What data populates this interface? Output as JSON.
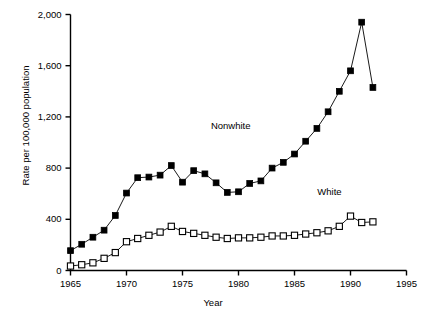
{
  "chart_data": {
    "type": "line",
    "title": "",
    "xlabel": "Year",
    "ylabel": "Rate per 100,000 population",
    "xlim": [
      1965,
      1995
    ],
    "ylim": [
      0,
      2000
    ],
    "xticks": [
      1965,
      1970,
      1975,
      1980,
      1985,
      1990,
      1995
    ],
    "xtick_labels": [
      "1965",
      "1970",
      "1975",
      "1980",
      "1985",
      "1990",
      "1995"
    ],
    "yticks": [
      0,
      400,
      800,
      1200,
      1600,
      2000
    ],
    "ytick_labels": [
      "0",
      "400",
      "800",
      "1,200",
      "1,600",
      "2,000"
    ],
    "grid": false,
    "legend_position": "inline-annotation",
    "x": [
      1965,
      1966,
      1967,
      1968,
      1969,
      1970,
      1971,
      1972,
      1973,
      1974,
      1975,
      1976,
      1977,
      1978,
      1979,
      1980,
      1981,
      1982,
      1983,
      1984,
      1985,
      1986,
      1987,
      1988,
      1989,
      1990,
      1991,
      1992
    ],
    "series": [
      {
        "name": "Nonwhite",
        "marker": "filled-square",
        "color": "#000000",
        "values": [
          155,
          205,
          260,
          315,
          430,
          605,
          725,
          730,
          745,
          820,
          690,
          780,
          755,
          685,
          610,
          615,
          680,
          700,
          800,
          845,
          910,
          1010,
          1110,
          1240,
          1400,
          1560,
          1940,
          1430
        ]
      },
      {
        "name": "White",
        "marker": "open-square",
        "color": "#000000",
        "values": [
          35,
          45,
          60,
          95,
          140,
          225,
          250,
          275,
          300,
          345,
          305,
          290,
          275,
          260,
          250,
          255,
          255,
          260,
          270,
          270,
          275,
          285,
          295,
          310,
          345,
          425,
          375,
          380
        ]
      }
    ],
    "annotations": [
      {
        "text": "Nonwhite",
        "x": 1979.5,
        "y": 1130
      },
      {
        "text": "White",
        "x": 1989.0,
        "y": 615
      }
    ]
  }
}
